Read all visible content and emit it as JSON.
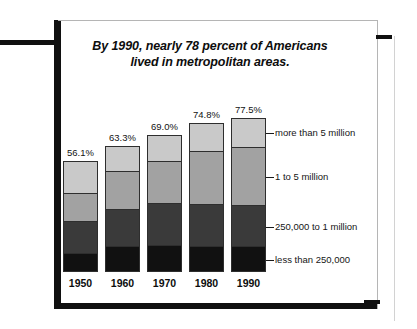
{
  "title": {
    "line1": "By 1990, nearly 78 percent of Americans",
    "line2": "lived in metropolitan areas."
  },
  "legend": {
    "items": [
      {
        "label": "more than 5 million",
        "color": "#c9c9c9"
      },
      {
        "label": "1 to 5 million",
        "color": "#a2a2a2"
      },
      {
        "label": "250,000 to 1 million",
        "color": "#3a3a3a"
      },
      {
        "label": "less than 250,000",
        "color": "#111111"
      }
    ]
  },
  "chart_data": {
    "type": "bar",
    "title": "By 1990, nearly 78 percent of Americans lived in metropolitan areas.",
    "xlabel": "",
    "ylabel": "",
    "ylim": [
      0,
      100
    ],
    "grid": false,
    "stacked": true,
    "legend_position": "right",
    "categories": [
      "1950",
      "1960",
      "1970",
      "1980",
      "1990"
    ],
    "total_labels": [
      "56.1%",
      "63.3%",
      "69.0%",
      "74.8%",
      "77.5%"
    ],
    "totals": [
      56.1,
      63.3,
      69.0,
      74.8,
      77.5
    ],
    "series": [
      {
        "name": "less than 250,000",
        "color": "#111111",
        "values": [
          16,
          20,
          19,
          17,
          16
        ]
      },
      {
        "name": "250,000 to 1 million",
        "color": "#3a3a3a",
        "values": [
          29,
          30,
          31,
          28,
          27
        ]
      },
      {
        "name": "1 to 5 million",
        "color": "#a2a2a2",
        "values": [
          26,
          30,
          31,
          36,
          38
        ]
      },
      {
        "name": "more than 5 million",
        "color": "#c9c9c9",
        "values": [
          29,
          20,
          19,
          19,
          19
        ]
      }
    ],
    "bar_totals": [
      100,
      100,
      100,
      100,
      100
    ],
    "note": "Each bar is a 100% stack of metropolitan size classes; the percent label above each bar is the share of Americans in metropolitan areas that year."
  }
}
